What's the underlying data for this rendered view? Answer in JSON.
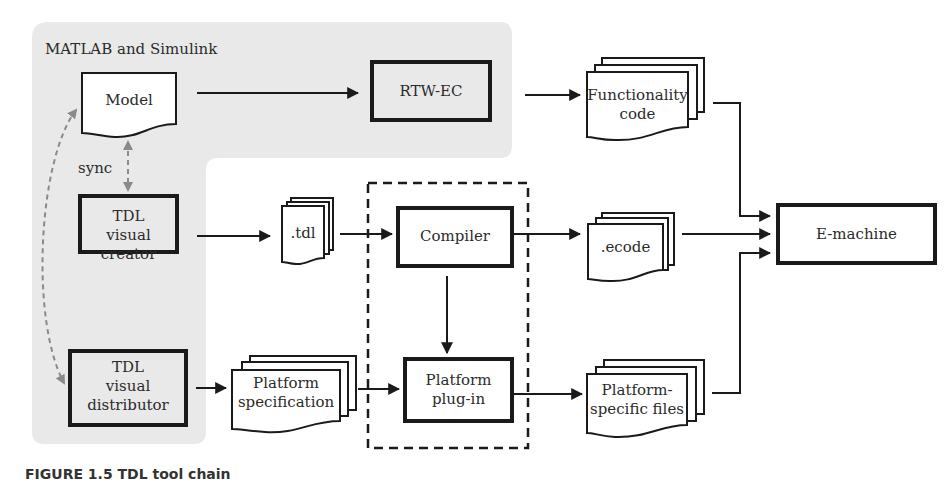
{
  "diagram": {
    "group": {
      "title": "MATLAB and Simulink",
      "background": "#e9e9e9"
    },
    "sync_label": "sync",
    "nodes": {
      "model": "Model",
      "rtw_ec": "RTW-EC",
      "functionality_code": [
        "Functionality",
        "code"
      ],
      "tdl_visual_creator": [
        "TDL",
        "visual",
        "creator"
      ],
      "tdl_file": ".tdl",
      "compiler": "Compiler",
      "ecode": ".ecode",
      "e_machine": "E-machine",
      "tdl_visual_distributor": [
        "TDL",
        "visual",
        "distributor"
      ],
      "platform_specification": [
        "Platform",
        "specification"
      ],
      "platform_plugin": [
        "Platform",
        "plug-in"
      ],
      "platform_specific_files": [
        "Platform-",
        "specific files"
      ]
    },
    "edges": [
      {
        "from": "model",
        "to": "rtw_ec"
      },
      {
        "from": "rtw_ec",
        "to": "functionality_code"
      },
      {
        "from": "functionality_code",
        "to": "e_machine"
      },
      {
        "from": "tdl_visual_creator",
        "to": "tdl_file"
      },
      {
        "from": "tdl_file",
        "to": "compiler"
      },
      {
        "from": "compiler",
        "to": "ecode"
      },
      {
        "from": "ecode",
        "to": "e_machine"
      },
      {
        "from": "compiler",
        "to": "platform_plugin"
      },
      {
        "from": "tdl_visual_distributor",
        "to": "platform_specification"
      },
      {
        "from": "platform_specification",
        "to": "platform_plugin"
      },
      {
        "from": "platform_plugin",
        "to": "platform_specific_files"
      },
      {
        "from": "platform_specific_files",
        "to": "e_machine"
      },
      {
        "from": "model",
        "to": "tdl_visual_creator",
        "style": "dashed-bidirectional",
        "label": "sync"
      },
      {
        "from": "model",
        "to": "tdl_visual_distributor",
        "style": "dashed-bidirectional-curve"
      }
    ],
    "colors": {
      "stroke": "#1a1a1a",
      "dashed_sync": "#8a8a8a"
    }
  },
  "caption": "FIGURE 1.5   TDL tool chain"
}
